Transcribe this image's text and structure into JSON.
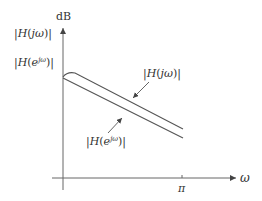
{
  "diagram": {
    "y_axis_label": "dB",
    "x_axis_label": "ω",
    "x_tick_label": "π",
    "legend_left": [
      "|H(jω)|",
      "|H(e^{jω})|"
    ],
    "curves": [
      {
        "name": "analog",
        "label": "|H(jω)|",
        "label_display": "|H(jω)|"
      },
      {
        "name": "digital",
        "label": "|H(e^{jω})|",
        "label_display_base": "|H(e",
        "label_display_sup": "jω",
        "label_display_tail": ")|"
      }
    ],
    "colors": {
      "line": "#555555",
      "text": "#333333"
    }
  }
}
